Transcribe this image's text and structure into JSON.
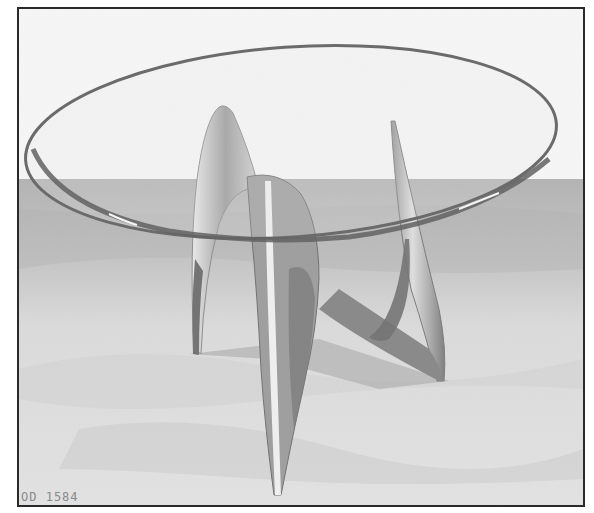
{
  "photo": {
    "subject": "Glass-top table with sculptural metal base on sand",
    "caption": "OD 1584",
    "colors": {
      "sky": "#f2f2f2",
      "backdrop_band": "#9a9a9a",
      "sand": "#cfcfcf",
      "glass_edge": "#1e1e1e",
      "metal_light": "#d8d8d8",
      "metal_dark": "#4a4a4a",
      "frame": "#2a2a2a"
    }
  }
}
